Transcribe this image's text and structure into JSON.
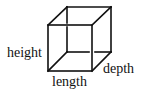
{
  "diagram": {
    "type": "wireframe-cube",
    "stroke_color": "#111111",
    "background": "#ffffff",
    "labels": {
      "height": "height",
      "length": "length",
      "depth": "depth"
    }
  }
}
